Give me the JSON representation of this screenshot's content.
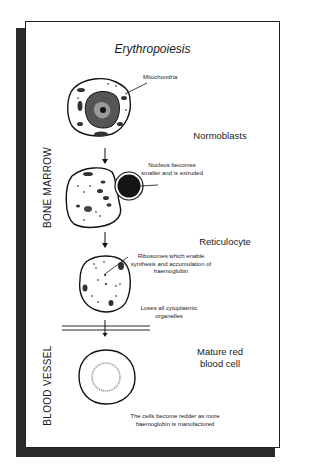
{
  "title": "Erythropoiesis",
  "regions": {
    "bone_marrow": "BONE MARROW",
    "blood_vessel": "BLOOD VESSEL"
  },
  "stages": [
    {
      "name": "Normoblasts"
    },
    {
      "name": "Reticulocyte"
    },
    {
      "name": "Mature red blood cell"
    }
  ],
  "annotations": {
    "mitochondria": "Mitochondria",
    "nucleus": "Nucleus becomes smaller and is extruded",
    "ribosomes": "Ribosomes which enable synthesis and accumulation of haemoglobin",
    "organelles": "Loses all cytoplasmic organelles",
    "redder": "The cells become redder as more haemoglobin is manufactured"
  },
  "colors": {
    "frame": "#222222",
    "shadow": "#2a2a2a",
    "nucleus": "#1a1a1a",
    "pale_center": "#9a9a9a"
  }
}
